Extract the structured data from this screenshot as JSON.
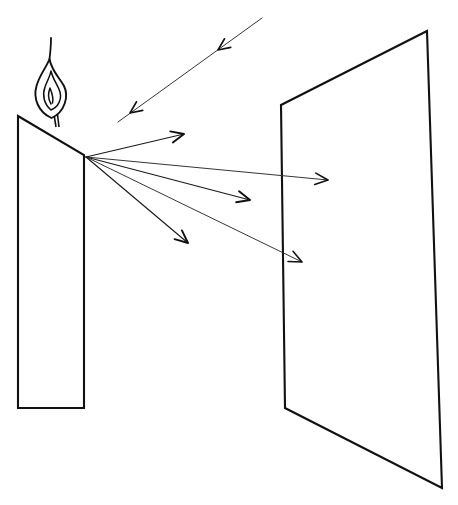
{
  "diagram": {
    "background_color": "#ffffff",
    "stroke_color": "#111111",
    "canvas": {
      "width": 458,
      "height": 505
    },
    "objects": {
      "candle": {
        "label": "candle",
        "body_points": "18,116 84,155 84,408 18,408",
        "wick": {
          "x1": 52,
          "y1": 102,
          "x2": 56,
          "y2": 127
        },
        "flame": {
          "label": "flame",
          "outer_path": "M 51.5,118 C 38,112 33,98 36.5,86 C 39.5,75 46,68 49.5,59 C 52,72 60,78 64,86 C 69,96 65,112 51.5,118 Z",
          "inner_path": "M 51,110 C 44,104 42,95 45,87 C 47,81 50,77 51,71 C 53,80 58,85 60,92 C 62,100 58,107 51,110 Z",
          "core_path": "M 51,104 C 48,99 48,93 50,88 C 52,93 54,98 52.5,103",
          "tip_path": "M 49.5,59 C 50.5,51 51,44 51,38"
        }
      },
      "screen": {
        "label": "screen",
        "points": "281,105 427,31 442,488 285,408"
      }
    },
    "rays": {
      "origin": {
        "x": 86,
        "y": 157,
        "label": "light-source-point"
      },
      "outgoing": [
        {
          "id": "ray-1",
          "label": "ray-upper",
          "x1": 86,
          "y1": 157,
          "x2": 184,
          "y2": 134,
          "arrow_angle": -13
        },
        {
          "id": "ray-2",
          "label": "ray-to-screen-upper",
          "x1": 86,
          "y1": 157,
          "x2": 328,
          "y2": 180,
          "arrow_angle": 6
        },
        {
          "id": "ray-3",
          "label": "ray-middle",
          "x1": 86,
          "y1": 157,
          "x2": 250,
          "y2": 200,
          "arrow_angle": 15
        },
        {
          "id": "ray-4",
          "label": "ray-to-screen-lower",
          "x1": 86,
          "y1": 157,
          "x2": 302,
          "y2": 262,
          "arrow_angle": 26
        },
        {
          "id": "ray-5",
          "label": "ray-lower",
          "x1": 86,
          "y1": 157,
          "x2": 188,
          "y2": 243,
          "arrow_angle": 40
        }
      ],
      "incoming": {
        "id": "ray-incoming",
        "label": "incoming-ray",
        "x1": 262,
        "y1": 18,
        "x2": 118,
        "y2": 122,
        "direction_angle": 144,
        "arrowheads": [
          {
            "x": 218,
            "y": 50
          },
          {
            "x": 130,
            "y": 113
          }
        ]
      }
    }
  }
}
